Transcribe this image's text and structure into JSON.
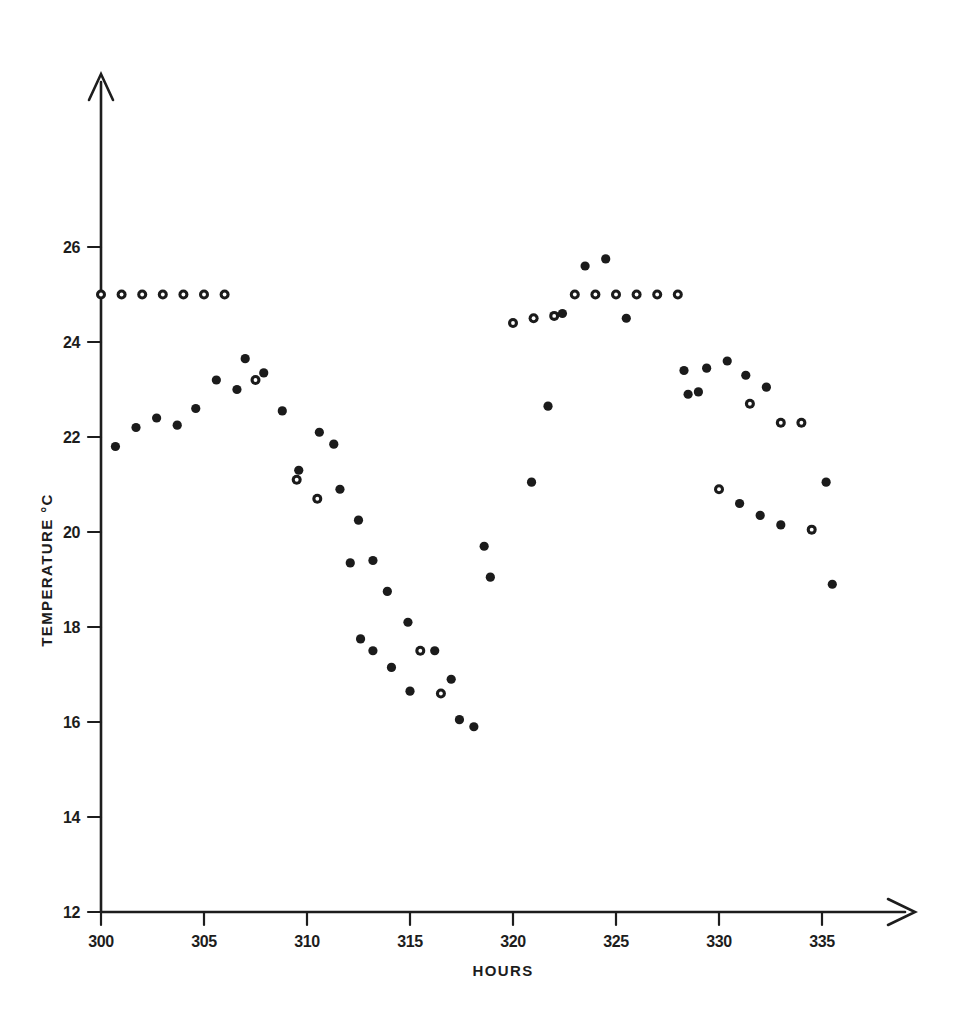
{
  "figure": {
    "background": "#ffffff",
    "ink_color": "#1b1b1b"
  },
  "axes": {
    "x": {
      "title": "HOURS",
      "ticks": [
        300,
        305,
        310,
        315,
        320,
        325,
        330,
        335
      ],
      "tick_labels": [
        "300",
        "305",
        "310",
        "315",
        "320",
        "325",
        "330",
        "335"
      ],
      "range": [
        300,
        337.5
      ],
      "arrow": true
    },
    "y": {
      "title": "TEMPERATURE °C",
      "ticks": [
        12,
        14,
        16,
        18,
        20,
        22,
        24,
        26
      ],
      "tick_labels": [
        "12",
        "14",
        "16",
        "18",
        "20",
        "22",
        "24",
        "26"
      ],
      "range": [
        12,
        27.2
      ],
      "arrow": true
    }
  },
  "chart_data": {
    "type": "scatter",
    "title": "",
    "xlabel": "HOURS",
    "ylabel": "TEMPERATURE °C",
    "xlim": [
      300,
      337.5
    ],
    "ylim": [
      12,
      27.2
    ],
    "grid": false,
    "legend": "none",
    "marker_styles": {
      "filled": "solid black dot",
      "open": "black ring with white centre"
    },
    "series": [
      {
        "name": "Series A (open markers)",
        "marker": "open",
        "points": [
          {
            "x": 300.0,
            "y": 25.0
          },
          {
            "x": 301.0,
            "y": 25.0
          },
          {
            "x": 302.0,
            "y": 25.0
          },
          {
            "x": 303.0,
            "y": 25.0
          },
          {
            "x": 304.0,
            "y": 25.0
          },
          {
            "x": 305.0,
            "y": 25.0
          },
          {
            "x": 306.0,
            "y": 25.0
          },
          {
            "x": 307.5,
            "y": 23.2
          },
          {
            "x": 309.5,
            "y": 21.1
          },
          {
            "x": 310.5,
            "y": 20.7
          },
          {
            "x": 315.5,
            "y": 17.5
          },
          {
            "x": 316.5,
            "y": 16.6
          },
          {
            "x": 320.0,
            "y": 24.4
          },
          {
            "x": 321.0,
            "y": 24.5
          },
          {
            "x": 322.0,
            "y": 24.55
          },
          {
            "x": 323.0,
            "y": 25.0
          },
          {
            "x": 324.0,
            "y": 25.0
          },
          {
            "x": 325.0,
            "y": 25.0
          },
          {
            "x": 326.0,
            "y": 25.0
          },
          {
            "x": 327.0,
            "y": 25.0
          },
          {
            "x": 328.0,
            "y": 25.0
          },
          {
            "x": 330.0,
            "y": 20.9
          },
          {
            "x": 331.5,
            "y": 22.7
          },
          {
            "x": 333.0,
            "y": 22.3
          },
          {
            "x": 334.0,
            "y": 22.3
          },
          {
            "x": 334.5,
            "y": 20.05
          }
        ]
      },
      {
        "name": "Series B (filled markers)",
        "marker": "filled",
        "points": [
          {
            "x": 300.7,
            "y": 21.8
          },
          {
            "x": 301.7,
            "y": 22.2
          },
          {
            "x": 302.7,
            "y": 22.4
          },
          {
            "x": 303.7,
            "y": 22.25
          },
          {
            "x": 304.6,
            "y": 22.6
          },
          {
            "x": 305.6,
            "y": 23.2
          },
          {
            "x": 306.6,
            "y": 23.0
          },
          {
            "x": 307.0,
            "y": 23.65
          },
          {
            "x": 307.9,
            "y": 23.35
          },
          {
            "x": 308.8,
            "y": 22.55
          },
          {
            "x": 309.6,
            "y": 21.3
          },
          {
            "x": 310.6,
            "y": 22.1
          },
          {
            "x": 311.3,
            "y": 21.85
          },
          {
            "x": 311.6,
            "y": 20.9
          },
          {
            "x": 312.5,
            "y": 20.25
          },
          {
            "x": 312.1,
            "y": 19.35
          },
          {
            "x": 312.6,
            "y": 17.75
          },
          {
            "x": 313.2,
            "y": 19.4
          },
          {
            "x": 313.2,
            "y": 17.5
          },
          {
            "x": 313.9,
            "y": 18.75
          },
          {
            "x": 314.1,
            "y": 17.15
          },
          {
            "x": 314.9,
            "y": 18.1
          },
          {
            "x": 315.0,
            "y": 16.65
          },
          {
            "x": 316.2,
            "y": 17.5
          },
          {
            "x": 317.0,
            "y": 16.9
          },
          {
            "x": 317.4,
            "y": 16.05
          },
          {
            "x": 318.1,
            "y": 15.9
          },
          {
            "x": 318.6,
            "y": 19.7
          },
          {
            "x": 318.9,
            "y": 19.05
          },
          {
            "x": 320.9,
            "y": 21.05
          },
          {
            "x": 321.7,
            "y": 22.65
          },
          {
            "x": 322.4,
            "y": 24.6
          },
          {
            "x": 323.5,
            "y": 25.6
          },
          {
            "x": 324.5,
            "y": 25.75
          },
          {
            "x": 325.5,
            "y": 24.5
          },
          {
            "x": 328.3,
            "y": 23.4
          },
          {
            "x": 328.5,
            "y": 22.9
          },
          {
            "x": 329.0,
            "y": 22.95
          },
          {
            "x": 329.4,
            "y": 23.45
          },
          {
            "x": 330.4,
            "y": 23.6
          },
          {
            "x": 331.0,
            "y": 20.6
          },
          {
            "x": 331.3,
            "y": 23.3
          },
          {
            "x": 332.0,
            "y": 20.35
          },
          {
            "x": 332.3,
            "y": 23.05
          },
          {
            "x": 333.0,
            "y": 20.15
          },
          {
            "x": 335.2,
            "y": 21.05
          },
          {
            "x": 335.5,
            "y": 18.9
          }
        ]
      }
    ]
  }
}
